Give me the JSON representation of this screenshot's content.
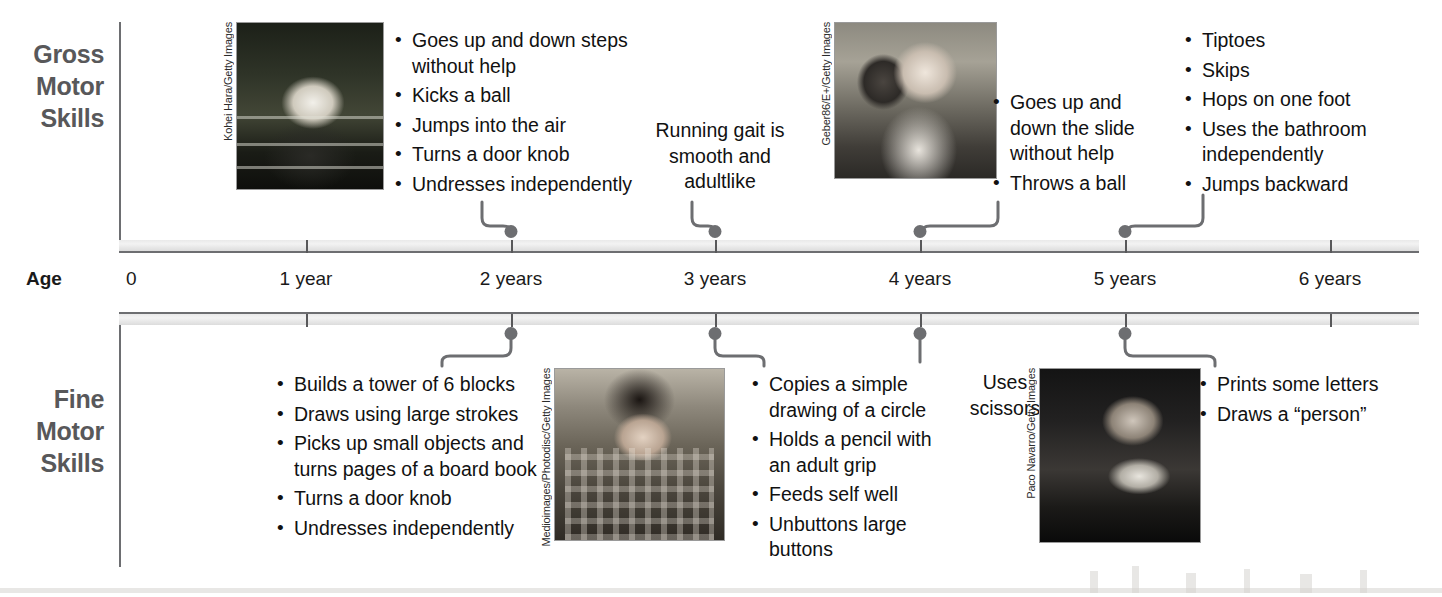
{
  "diagram": {
    "axis_label": "Age",
    "axis_origin": "0",
    "accent_color": "#6d6e71",
    "text_color": "#111111"
  },
  "sections": {
    "gross": {
      "line1": "Gross",
      "line2": "Motor",
      "line3": "Skills"
    },
    "fine": {
      "line1": "Fine",
      "line2": "Motor",
      "line3": "Skills"
    }
  },
  "axis": {
    "ticks": [
      {
        "label": "1 year",
        "value": 1
      },
      {
        "label": "2 years",
        "value": 2
      },
      {
        "label": "3 years",
        "value": 3
      },
      {
        "label": "4 years",
        "value": 4
      },
      {
        "label": "5 years",
        "value": 5
      },
      {
        "label": "6 years",
        "value": 6
      }
    ]
  },
  "gross_motor": {
    "group_2y": {
      "age": "2 years",
      "items": [
        "Goes up and down steps without help",
        "Kicks a ball",
        "Jumps into the air",
        "Turns a door knob",
        "Undresses independently"
      ]
    },
    "group_3y": {
      "age": "3 years",
      "note": "Running gait is smooth and adultlike"
    },
    "group_4y": {
      "age": "4 years",
      "items": [
        "Goes up and down the slide without help",
        "Throws a ball"
      ]
    },
    "group_5y": {
      "age": "5 years",
      "items": [
        "Tiptoes",
        "Skips",
        "Hops on one foot",
        "Uses the bathroom independently",
        "Jumps backward"
      ]
    }
  },
  "fine_motor": {
    "group_2y": {
      "age": "2 years",
      "items": [
        "Builds a tower of 6 blocks",
        "Draws using large strokes",
        "Picks up small objects and turns pages of a board book",
        "Turns a door knob",
        "Undresses independently"
      ]
    },
    "group_3y": {
      "age": "3 years",
      "items": [
        "Copies a simple drawing of a circle",
        "Holds a pencil with an adult grip",
        "Feeds self well",
        "Unbuttons large buttons"
      ]
    },
    "group_4y": {
      "age": "4 years",
      "note": "Uses scissors"
    },
    "group_5y": {
      "age": "5 years",
      "items": [
        "Prints some letters",
        "Draws a “person”"
      ]
    }
  },
  "photos": [
    {
      "id": "photo1",
      "credit": "Kohei Hara/Getty Images"
    },
    {
      "id": "photo2",
      "credit": "Geber86/E+/Getty Images"
    },
    {
      "id": "photo3",
      "credit": "Medioimages/Photodisc/Getty Images"
    },
    {
      "id": "photo4",
      "credit": "Paco Navarro/Getty Images"
    }
  ]
}
